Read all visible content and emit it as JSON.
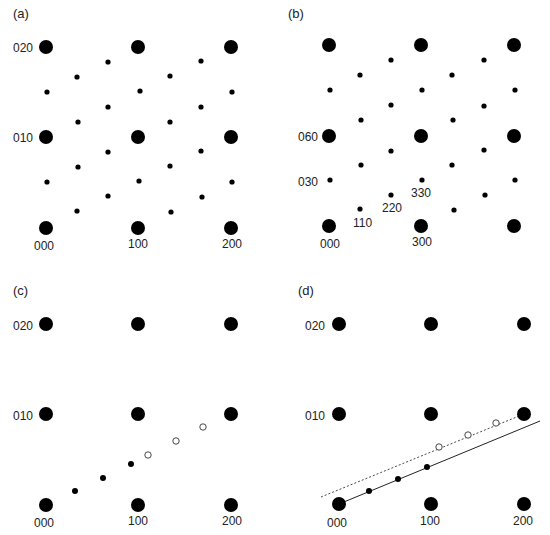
{
  "panels": [
    {
      "id": "a",
      "label": "(a)",
      "big_spots": [
        [
          46,
          47
        ],
        [
          138,
          47
        ],
        [
          231,
          47
        ],
        [
          46,
          137
        ],
        [
          138,
          137
        ],
        [
          231,
          137
        ],
        [
          46,
          228
        ],
        [
          138,
          228
        ],
        [
          231,
          228
        ]
      ],
      "small_spots": [
        [
          108,
          62
        ],
        [
          77,
          77
        ],
        [
          47,
          92
        ],
        [
          140,
          91
        ],
        [
          108,
          107
        ],
        [
          78,
          122
        ],
        [
          170,
          76
        ],
        [
          201,
          61
        ],
        [
          232,
          92
        ],
        [
          201,
          107
        ],
        [
          170,
          122
        ],
        [
          108,
          152
        ],
        [
          78,
          167
        ],
        [
          47,
          182
        ],
        [
          139,
          181
        ],
        [
          108,
          196
        ],
        [
          77,
          211
        ],
        [
          170,
          166
        ],
        [
          201,
          151
        ],
        [
          232,
          182
        ],
        [
          202,
          197
        ],
        [
          171,
          212
        ]
      ],
      "labels": [
        {
          "text": "020",
          "x": 13,
          "y": 52
        },
        {
          "text": "010",
          "x": 13,
          "y": 142
        },
        {
          "text": "000",
          "x": 34,
          "y": 250
        },
        {
          "text": "100",
          "x": 128,
          "y": 248
        },
        {
          "text": "200",
          "x": 222,
          "y": 248
        }
      ]
    },
    {
      "id": "b",
      "label": "(b)",
      "big_spots": [
        [
          329,
          45
        ],
        [
          421,
          45
        ],
        [
          514,
          45
        ],
        [
          329,
          136
        ],
        [
          421,
          136
        ],
        [
          514,
          136
        ],
        [
          329,
          226
        ],
        [
          421,
          226
        ],
        [
          514,
          226
        ]
      ],
      "small_spots": [
        [
          391,
          60
        ],
        [
          360,
          75
        ],
        [
          330,
          90
        ],
        [
          422,
          90
        ],
        [
          391,
          105
        ],
        [
          361,
          120
        ],
        [
          452,
          75
        ],
        [
          484,
          60
        ],
        [
          515,
          90
        ],
        [
          484,
          106
        ],
        [
          453,
          120
        ],
        [
          391,
          151
        ],
        [
          361,
          165
        ],
        [
          330,
          180
        ],
        [
          422,
          180
        ],
        [
          391,
          195
        ],
        [
          360,
          209
        ],
        [
          452,
          165
        ],
        [
          484,
          150
        ],
        [
          515,
          180
        ],
        [
          485,
          195
        ],
        [
          454,
          210
        ]
      ],
      "labels": [
        {
          "text": "060",
          "x": 298,
          "y": 141
        },
        {
          "text": "030",
          "x": 298,
          "y": 186
        },
        {
          "text": "330",
          "x": 411,
          "y": 197
        },
        {
          "text": "220",
          "x": 382,
          "y": 212
        },
        {
          "text": "110",
          "x": 353,
          "y": 227
        },
        {
          "text": "000",
          "x": 320,
          "y": 248
        },
        {
          "text": "300",
          "x": 412,
          "y": 246
        }
      ]
    },
    {
      "id": "c",
      "label": "(c)",
      "big_spots": [
        [
          46,
          324
        ],
        [
          138,
          324
        ],
        [
          231,
          324
        ],
        [
          46,
          414
        ],
        [
          138,
          414
        ],
        [
          231,
          414
        ],
        [
          46,
          505
        ],
        [
          138,
          505
        ],
        [
          231,
          505
        ]
      ],
      "filled_dots": [
        [
          75,
          491
        ],
        [
          103,
          478
        ],
        [
          131,
          464
        ]
      ],
      "open_dots": [
        [
          148,
          455
        ],
        [
          176,
          441
        ],
        [
          203,
          427
        ]
      ],
      "labels": [
        {
          "text": "020",
          "x": 13,
          "y": 330
        },
        {
          "text": "010",
          "x": 13,
          "y": 420
        },
        {
          "text": "000",
          "x": 34,
          "y": 527
        },
        {
          "text": "100",
          "x": 128,
          "y": 525
        },
        {
          "text": "200",
          "x": 222,
          "y": 525
        }
      ]
    },
    {
      "id": "d",
      "label": "(d)",
      "big_spots": [
        [
          339,
          324
        ],
        [
          431,
          324
        ],
        [
          524,
          324
        ],
        [
          339,
          414
        ],
        [
          431,
          414
        ],
        [
          524,
          414
        ],
        [
          339,
          504
        ],
        [
          431,
          504
        ],
        [
          524,
          504
        ]
      ],
      "filled_dots": [
        [
          369,
          491
        ],
        [
          398,
          479
        ],
        [
          427,
          467
        ]
      ],
      "open_dots": [
        [
          439,
          447
        ],
        [
          468,
          435
        ],
        [
          496,
          423
        ]
      ],
      "solid_line": [
        339,
        504,
        540,
        421
      ],
      "dashed_line": [
        321,
        497,
        524,
        414
      ],
      "labels": [
        {
          "text": "020",
          "x": 305,
          "y": 330
        },
        {
          "text": "010",
          "x": 305,
          "y": 420
        },
        {
          "text": "000",
          "x": 327,
          "y": 527
        },
        {
          "text": "100",
          "x": 420,
          "y": 525
        },
        {
          "text": "200",
          "x": 513,
          "y": 525
        }
      ]
    }
  ],
  "panel_label_positions": [
    [
      13,
      18
    ],
    [
      288,
      18
    ],
    [
      13,
      295
    ],
    [
      298,
      295
    ]
  ],
  "style": {
    "spot_color": "#000000",
    "big_radius": 7,
    "small_radius": 2.6,
    "dot_radius": 3,
    "open_radius": 3.2
  }
}
